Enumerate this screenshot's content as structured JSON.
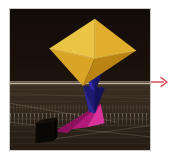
{
  "scene": {
    "title": "3d-rendered-shapes-thumbnail",
    "background_color": "#160f0a",
    "ground_color": "#352a20",
    "horizon_color": "#e4d6c2",
    "frame_border_color": "#cfc9c4",
    "objects": [
      {
        "name": "yellow-octahedron",
        "shape": "octahedron",
        "color": "#e0b231",
        "highlight_color": "#f0cb52",
        "shadow_color": "#b8860d",
        "position": {
          "x": 86,
          "y": 42
        },
        "size": {
          "w": 86,
          "h": 72
        }
      },
      {
        "name": "blue-cone-upper",
        "shape": "cone",
        "color": "#1f1d72",
        "highlight_color": "#2e2a9a",
        "position": {
          "x": 86,
          "y": 70
        },
        "size": {
          "w": 20,
          "h": 30
        }
      },
      {
        "name": "blue-cone-lower",
        "shape": "cone",
        "color": "#211f7e",
        "highlight_color": "#322ea8",
        "position": {
          "x": 84,
          "y": 92
        },
        "size": {
          "w": 22,
          "h": 28
        }
      },
      {
        "name": "magenta-spike",
        "shape": "cone",
        "color": "#c01d84",
        "highlight_color": "#e03a9e",
        "position": {
          "x": 66,
          "y": 112
        },
        "size": {
          "w": 52,
          "h": 26
        }
      },
      {
        "name": "black-cube",
        "shape": "cube",
        "color": "#0c0906",
        "position": {
          "x": 34,
          "y": 124
        },
        "size": {
          "w": 18,
          "h": 20
        }
      }
    ]
  },
  "annotation": {
    "arrow": {
      "name": "red-pointer-arrow",
      "color": "#d4414c",
      "direction": "right",
      "x": 151,
      "y": 82,
      "length": 18
    }
  }
}
